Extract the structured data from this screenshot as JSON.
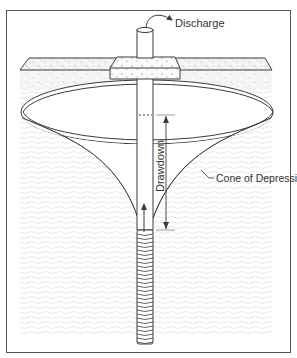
{
  "diagram": {
    "labels": {
      "discharge": "Discharge",
      "drawdown": "Drawdown",
      "cone": "Cone of Depression"
    },
    "colors": {
      "line": "#3a3a3a",
      "frame": "#555555",
      "soil_texture": "#c9c9c9",
      "water_texture": "#e2e2e2",
      "background": "#ffffff"
    },
    "components": [
      "ground-surface",
      "concrete-pad",
      "well-casing",
      "discharge-pipe",
      "water-table-ellipse",
      "cone-of-depression",
      "drawdown-arrow",
      "flow-arrow",
      "well-screen"
    ]
  }
}
